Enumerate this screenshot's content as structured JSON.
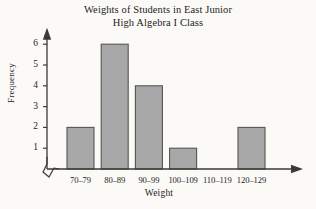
{
  "chart_data": {
    "type": "bar",
    "title": "Weights of Students in East Junior High Algebra I Class",
    "title_lines": [
      "Weights of Students in East Junior",
      "High Algebra I Class"
    ],
    "xlabel": "Weight",
    "ylabel": "Frequency",
    "categories": [
      "70–79",
      "80–89",
      "90–99",
      "100–109",
      "110–119",
      "120–129"
    ],
    "values": [
      2,
      6,
      4,
      1,
      0,
      2
    ],
    "ytick_labels": [
      "1",
      "2",
      "3",
      "4",
      "5",
      "6"
    ],
    "ytick_values": [
      1,
      2,
      3,
      4,
      5,
      6
    ],
    "ylim": [
      0,
      6.6
    ],
    "grid": false,
    "legend": null,
    "axis_break": "zigzag-at-origin",
    "y_axis_arrow": true,
    "x_axis_arrow": true,
    "colors": {
      "bar_fill": "#a8a8a8",
      "bar_stroke": "#555555",
      "axis": "#3a3a3a",
      "text": "#1d1d1d",
      "background": "#fbfaf7"
    }
  }
}
